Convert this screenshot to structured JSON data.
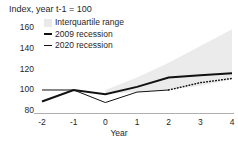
{
  "chart_data": {
    "type": "line",
    "title": "Index, year t-1 = 100",
    "xlabel": "Year",
    "ylabel": "",
    "x": [
      -2,
      -1,
      0,
      1,
      2,
      3,
      4
    ],
    "xlim": [
      -2,
      4
    ],
    "ylim": [
      78,
      165
    ],
    "grid": false,
    "legend_position": "top-left",
    "y_ticks": [
      {
        "value": 160,
        "label": "160"
      },
      {
        "value": 140,
        "label": "140"
      },
      {
        "value": 120,
        "label": "120"
      },
      {
        "value": 100,
        "label": "100"
      },
      {
        "value": 80,
        "label": "80"
      }
    ],
    "x_ticks": [
      {
        "value": -2,
        "label": "-2"
      },
      {
        "value": -1,
        "label": "-1"
      },
      {
        "value": 0,
        "label": "0"
      },
      {
        "value": 1,
        "label": "1"
      },
      {
        "value": 2,
        "label": "2"
      },
      {
        "value": 3,
        "label": "3"
      },
      {
        "value": 4,
        "label": "4"
      }
    ],
    "series": [
      {
        "name": "2009 recession",
        "style": "solid",
        "width": 2,
        "color": "#111111",
        "x": [
          -2,
          -1,
          0,
          1,
          2,
          3,
          4
        ],
        "values": [
          89,
          100,
          96,
          103,
          112,
          114,
          116
        ]
      },
      {
        "name": "2020 recession",
        "style": "solid",
        "width": 1,
        "color": "#111111",
        "x": [
          -2,
          -1,
          0,
          1,
          2
        ],
        "values": [
          100,
          100,
          88,
          98,
          100
        ]
      },
      {
        "name": "2020 recession forecast",
        "style": "dotted",
        "width": 1.4,
        "color": "#111111",
        "x": [
          2,
          3,
          4
        ],
        "values": [
          100,
          107,
          111
        ]
      }
    ],
    "band": {
      "name": "Interquartile range",
      "color": "#ebebeb",
      "x": [
        0,
        1,
        2,
        3,
        4
      ],
      "upper": [
        100,
        112,
        126,
        142,
        158
      ],
      "lower": [
        96,
        98,
        100,
        104,
        110
      ]
    },
    "legend": [
      {
        "key": "band",
        "label": "Interquartile range",
        "marker": "band-swatch"
      },
      {
        "key": "rec2009",
        "label": "2009 recession",
        "marker": "thick-line"
      },
      {
        "key": "rec2020",
        "label": "2020 recession",
        "marker": "thin-line"
      }
    ]
  }
}
